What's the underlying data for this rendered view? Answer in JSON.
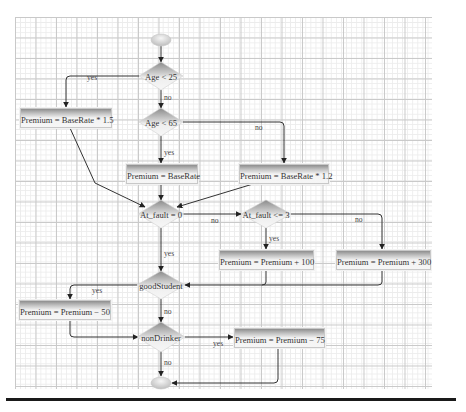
{
  "diagram": {
    "type": "flowchart",
    "title": "",
    "colors": {
      "grid_major": "#c9c9c9",
      "grid_minor": "#ececec",
      "shape_dark": "#8e8e8e",
      "shape_light": "#f3f3f3",
      "connector": "#333333",
      "rule": "#1a1a1a"
    },
    "nodes": {
      "start": {
        "type": "terminator",
        "label": ""
      },
      "age_lt_25": {
        "type": "decision",
        "label": "Age < 25"
      },
      "age_lt_65": {
        "type": "decision",
        "label": "Age < 65"
      },
      "premium_1_5": {
        "type": "process",
        "label": "Premium = BaseRate * 1.5"
      },
      "premium_base": {
        "type": "process",
        "label": "Premium = BaseRate"
      },
      "premium_1_2": {
        "type": "process",
        "label": "Premium = BaseRate * 1.2"
      },
      "at_fault_0": {
        "type": "decision",
        "label": "At_fault = 0"
      },
      "at_fault_le_3": {
        "type": "decision",
        "label": "At_fault <= 3"
      },
      "premium_plus_100": {
        "type": "process",
        "label": "Premium = Premium + 100"
      },
      "premium_plus_300": {
        "type": "process",
        "label": "Premium = Premium + 300"
      },
      "good_student": {
        "type": "decision",
        "label": "goodStudent"
      },
      "premium_minus_50": {
        "type": "process",
        "label": "Premium = Premium − 50"
      },
      "non_drinker": {
        "type": "decision",
        "label": "nonDrinker"
      },
      "premium_minus_75": {
        "type": "process",
        "label": "Premium = Premium − 75"
      },
      "end": {
        "type": "terminator",
        "label": ""
      }
    },
    "edges": {
      "age25_yes": "yes",
      "age25_no": "no",
      "age65_yes": "yes",
      "age65_no": "no",
      "fault0_yes": "yes",
      "fault0_no": "no",
      "fault3_yes": "yes",
      "fault3_no": "no",
      "student_yes": "yes",
      "student_no": "no",
      "drinker_yes": "yes",
      "drinker_no": "no"
    }
  }
}
